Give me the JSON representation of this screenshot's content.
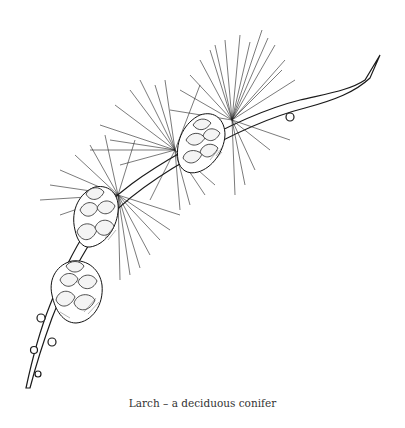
{
  "figure": {
    "style": "pen-and-ink line drawing",
    "cones_count": 3,
    "caption": "Larch – a deciduous conifer"
  },
  "colors": {
    "background": "#ffffff",
    "ink": "#111111",
    "caption_text": "#333333"
  }
}
